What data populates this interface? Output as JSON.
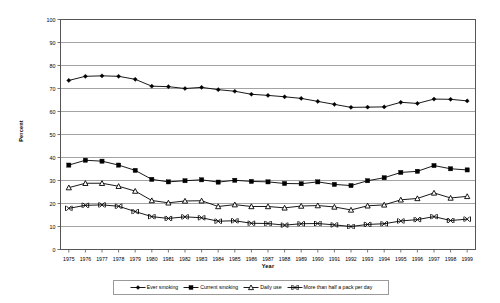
{
  "chart_data": {
    "type": "line",
    "title": "",
    "xlabel": "Year",
    "ylabel": "Percent",
    "ylim": [
      0,
      100
    ],
    "ytick_step": 10,
    "grid": true,
    "legend_position": "bottom",
    "categories": [
      "1975",
      "1976",
      "1977",
      "1978",
      "1979",
      "1980",
      "1981",
      "1982",
      "1983",
      "1984",
      "1985",
      "1986",
      "1987",
      "1988",
      "1989",
      "1990",
      "1991",
      "1992",
      "1993",
      "1994",
      "1995",
      "1996",
      "1997",
      "1998",
      "1999"
    ],
    "yticks": [
      "0",
      "10",
      "20",
      "30",
      "40",
      "50",
      "60",
      "70",
      "80",
      "90",
      "100"
    ],
    "series": [
      {
        "name": "Ever smoking",
        "marker": "diamond",
        "color": "#000000",
        "values": [
          73.5,
          75.3,
          75.5,
          75.3,
          74.0,
          71.0,
          70.8,
          70.0,
          70.5,
          69.5,
          68.8,
          67.5,
          67.0,
          66.4,
          65.7,
          64.4,
          63.1,
          61.8,
          61.9,
          62.0,
          64.0,
          63.5,
          65.4,
          65.3,
          64.6
        ]
      },
      {
        "name": "Current smoking",
        "marker": "square",
        "color": "#000000",
        "values": [
          36.7,
          38.8,
          38.4,
          36.7,
          34.4,
          30.5,
          29.4,
          29.9,
          30.3,
          29.3,
          30.1,
          29.6,
          29.4,
          28.7,
          28.6,
          29.4,
          28.3,
          27.8,
          29.9,
          31.2,
          33.5,
          34.0,
          36.5,
          35.1,
          34.6
        ]
      },
      {
        "name": "Daily use",
        "marker": "triangle",
        "color": "#000000",
        "values": [
          26.9,
          28.8,
          28.8,
          27.5,
          25.4,
          21.3,
          20.3,
          21.1,
          21.2,
          18.7,
          19.5,
          18.7,
          18.7,
          18.1,
          18.9,
          19.1,
          18.5,
          17.2,
          19.0,
          19.4,
          21.6,
          22.2,
          24.6,
          22.4,
          23.1
        ]
      },
      {
        "name": "More than half a pack per day",
        "marker": "x",
        "color": "#000000",
        "values": [
          17.9,
          19.2,
          19.4,
          18.8,
          16.5,
          14.3,
          13.5,
          14.2,
          13.8,
          12.3,
          12.5,
          11.4,
          11.3,
          10.6,
          11.2,
          11.3,
          10.7,
          10.0,
          10.9,
          11.2,
          12.4,
          13.0,
          14.3,
          12.6,
          13.2
        ]
      }
    ]
  },
  "axis": {
    "y_title": "Percent",
    "x_title": "Year"
  },
  "colors": {
    "plot_border": "#555555",
    "gridline": "#8c8c8c",
    "series_line": "#1a1a1a",
    "background": "#ffffff"
  }
}
